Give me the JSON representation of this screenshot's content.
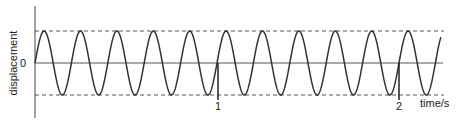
{
  "chart_data": {
    "type": "line",
    "title": "",
    "xlabel": "time/s",
    "ylabel": "displacement",
    "x_ticks": [
      "1",
      "2"
    ],
    "y_ticks": [
      "0"
    ],
    "series": [
      {
        "name": "displacement",
        "function": "sine",
        "amplitude": 1,
        "frequency_hz": 5,
        "period_s": 0.2,
        "phase": "starts at 0 rising",
        "x_range": [
          0,
          2.23
        ]
      }
    ],
    "reference_lines": [
      {
        "name": "positive amplitude",
        "y": 1,
        "style": "dashed"
      },
      {
        "name": "negative amplitude",
        "y": -1,
        "style": "dashed"
      }
    ],
    "xlim": [
      0,
      2.25
    ],
    "ylim": [
      -1.6,
      1.6
    ],
    "grid": false,
    "legend": "none"
  },
  "labels": {
    "ylabel": "displacement",
    "xlabel": "time/s",
    "zero": "0",
    "tick1": "1",
    "tick2": "2"
  },
  "colors": {
    "wave": "#333333",
    "axes": "#444444",
    "dashed": "#555555"
  }
}
